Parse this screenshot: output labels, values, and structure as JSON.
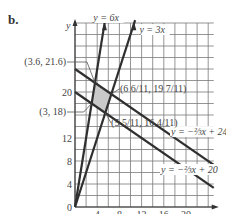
{
  "part_label": "b.",
  "chart_data": {
    "type": "line",
    "title": "",
    "xlabel": "",
    "ylabel": "y",
    "xlim": [
      0,
      25
    ],
    "ylim": [
      0,
      32
    ],
    "grid": true,
    "grid_step": 2,
    "x_ticks": [
      "0",
      "4",
      "8",
      "12",
      "16",
      "20"
    ],
    "x_tick_values": [
      0,
      4,
      8,
      12,
      16,
      20
    ],
    "y_ticks": [
      "0",
      "4",
      "8",
      "12",
      "20"
    ],
    "y_tick_values": [
      0,
      4,
      8,
      12,
      20
    ],
    "series": [
      {
        "name": "y = 6x",
        "label": "y = 6x",
        "slope": 6,
        "intercept": 0
      },
      {
        "name": "y = 3x",
        "label": "y = 3x",
        "slope": 3,
        "intercept": 0
      },
      {
        "name": "y = -2/3 x + 24",
        "label": "y = −⅔x + 24",
        "slope": -0.6667,
        "intercept": 24
      },
      {
        "name": "y = -2/3 x + 20",
        "label": "y = −⅔x + 20",
        "slope": -0.6667,
        "intercept": 20
      }
    ],
    "feasible_region": [
      [
        3,
        18
      ],
      [
        3.6,
        21.6
      ],
      [
        6.545,
        19.636
      ],
      [
        5.455,
        16.364
      ]
    ],
    "annotations": [
      {
        "text": "(3.6, 21.6)",
        "point": [
          3.6,
          21.6
        ]
      },
      {
        "text": "(3, 18)",
        "point": [
          3,
          18
        ]
      },
      {
        "text": "(6 6/11, 19 7/11)",
        "point": [
          6.545,
          19.636
        ]
      },
      {
        "text": "(5 5/11, 16 4/11)",
        "point": [
          5.455,
          16.364
        ]
      }
    ]
  }
}
